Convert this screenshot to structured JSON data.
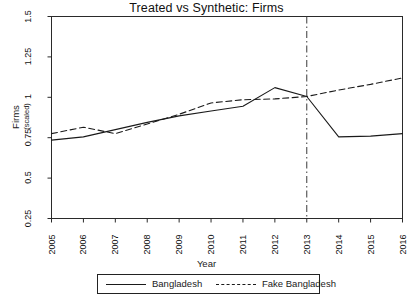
{
  "chart_data": {
    "type": "line",
    "title": "Treated vs Synthetic: Firms",
    "xlabel": "Year",
    "ylabel": "Firms",
    "ylabel_sub": "(scaled)",
    "x": [
      2005,
      2006,
      2007,
      2008,
      2009,
      2010,
      2011,
      2012,
      2013,
      2014,
      2015,
      2016
    ],
    "xtick_labels": [
      "2005",
      "2006",
      "2007",
      "2008",
      "2009",
      "2010",
      "2011",
      "2012",
      "2013",
      "2014",
      "2015",
      "2016"
    ],
    "ytick_labels": [
      "1.5",
      "1.25",
      "1",
      "0.75",
      "0.5",
      "0.25"
    ],
    "ytick_values": [
      1.5,
      1.25,
      1,
      0.75,
      0.5,
      0.25
    ],
    "xlim": [
      2005,
      2016
    ],
    "ylim": [
      0.25,
      1.5
    ],
    "grid": false,
    "legend_position": "below",
    "series": [
      {
        "name": "Bangladesh",
        "style": "solid",
        "color": "#1a1a1a",
        "values": [
          0.735,
          0.755,
          0.8,
          0.845,
          0.885,
          0.915,
          0.945,
          1.06,
          1.005,
          0.755,
          0.76,
          0.775
        ]
      },
      {
        "name": "Fake Bangladesh",
        "style": "dashed",
        "color": "#1a1a1a",
        "values": [
          0.775,
          0.815,
          0.775,
          0.835,
          0.895,
          0.965,
          0.985,
          0.99,
          1.005,
          1.045,
          1.08,
          1.12
        ]
      }
    ],
    "annotations": [
      {
        "type": "vline",
        "name": "intervention-line",
        "x": 2013,
        "style": "dash-dot",
        "color": "#3a3a3a"
      }
    ]
  },
  "legend": {
    "items": [
      {
        "label": "Bangladesh",
        "style": "solid"
      },
      {
        "label": "Fake Bangladesh",
        "style": "dashed"
      }
    ]
  }
}
